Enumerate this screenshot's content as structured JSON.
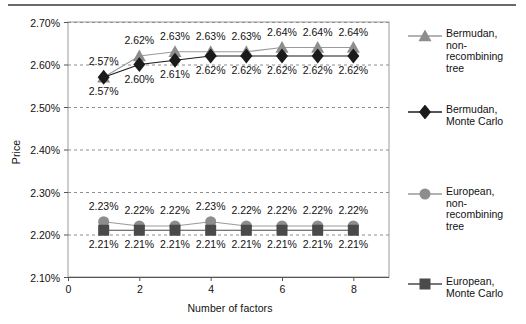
{
  "figure": {
    "rule_color": "#6a6a6a",
    "background": "#ffffff"
  },
  "chart_data": {
    "type": "line",
    "title": "",
    "subtitle": "",
    "xlabel": "Number of factors",
    "ylabel": "Price",
    "x": [
      1,
      2,
      3,
      4,
      5,
      6,
      7,
      8
    ],
    "xlim": [
      0,
      9
    ],
    "ylim": [
      2.1,
      2.7
    ],
    "xticks": [
      0,
      2,
      4,
      6,
      8
    ],
    "xtick_labels": [
      "0",
      "2",
      "4",
      "6",
      "8"
    ],
    "yticks": [
      2.1,
      2.2,
      2.3,
      2.4,
      2.5,
      2.6,
      2.7
    ],
    "ytick_labels": [
      "2.10%",
      "2.20%",
      "2.30%",
      "2.40%",
      "2.50%",
      "2.60%",
      "2.70%"
    ],
    "grid": "horizontal-dashed",
    "legend_position": "right",
    "series": [
      {
        "name": "Bermudan, non-recombining tree",
        "marker": "triangle",
        "color": "#8d8d8d",
        "line_color": "#9a9a9a",
        "values": [
          2.57,
          2.62,
          2.63,
          2.63,
          2.63,
          2.64,
          2.64,
          2.64
        ],
        "labels": [
          "2.57%",
          "2.62%",
          "2.63%",
          "2.63%",
          "2.63%",
          "2.64%",
          "2.64%",
          "2.64%"
        ],
        "label_position": "above"
      },
      {
        "name": "Bermudan, Monte Carlo",
        "marker": "diamond",
        "color": "#1b1b1b",
        "line_color": "#1b1b1b",
        "values": [
          2.57,
          2.6,
          2.61,
          2.62,
          2.62,
          2.62,
          2.62,
          2.62
        ],
        "labels": [
          "2.57%",
          "2.60%",
          "2.61%",
          "2.62%",
          "2.62%",
          "2.62%",
          "2.62%",
          "2.62%"
        ],
        "label_position": "below"
      },
      {
        "name": "European, non-recombining tree",
        "marker": "circle",
        "color": "#8d8d8d",
        "line_color": "#9a9a9a",
        "values": [
          2.23,
          2.22,
          2.22,
          2.23,
          2.22,
          2.22,
          2.22,
          2.22
        ],
        "labels": [
          "2.23%",
          "2.22%",
          "2.22%",
          "2.23%",
          "2.22%",
          "2.22%",
          "2.22%",
          "2.22%"
        ],
        "label_position": "above"
      },
      {
        "name": "European, Monte Carlo",
        "marker": "square",
        "color": "#4a4a4a",
        "line_color": "#4a4a4a",
        "values": [
          2.21,
          2.21,
          2.21,
          2.21,
          2.21,
          2.21,
          2.21,
          2.21
        ],
        "labels": [
          "2.21%",
          "2.21%",
          "2.21%",
          "2.21%",
          "2.21%",
          "2.21%",
          "2.21%",
          "2.21%"
        ],
        "label_position": "below"
      }
    ]
  },
  "legend": {
    "entries": [
      {
        "label": "Bermudan,\nnon-\nrecombining\ntree",
        "marker": "triangle",
        "color": "#8d8d8d",
        "line_color": "#9a9a9a",
        "top": 14
      },
      {
        "label": "Bermudan,\nMonte Carlo",
        "marker": "diamond",
        "color": "#1b1b1b",
        "line_color": "#1b1b1b",
        "top": 90
      },
      {
        "label": "European,\nnon-\nrecombining\ntree",
        "marker": "circle",
        "color": "#8d8d8d",
        "line_color": "#9a9a9a",
        "top": 172
      },
      {
        "label": "European,\nMonte Carlo",
        "marker": "square",
        "color": "#4a4a4a",
        "line_color": "#4a4a4a",
        "top": 262
      }
    ]
  }
}
